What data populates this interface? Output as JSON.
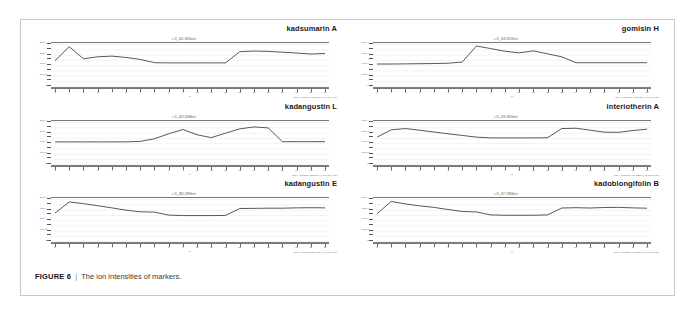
{
  "figure": {
    "caption_label": "FIGURE 6",
    "caption_separator": "|",
    "caption_text": "The ion intensities of markers.",
    "frame_color": "#c8c8c8",
    "background": "#ffffff",
    "line_color": "#3a3a3a"
  },
  "axis_defaults": {
    "x_caption": "h",
    "x_tick_labels": [
      "0",
      "1",
      "2",
      "3",
      "4",
      "5",
      "6",
      "7",
      "8",
      "9",
      "10",
      "11",
      "12",
      "13",
      "14",
      "15",
      "16",
      "17",
      "18",
      "19"
    ],
    "y_tick_labels": [
      "2.0e4",
      "1.5e4",
      "1.0e4",
      "5.0e3",
      "0",
      "-5.0e3",
      "-1.0e4"
    ]
  },
  "chart_data": [
    {
      "id": "kadsumarin-a",
      "type": "line",
      "title": "kadsumarin A",
      "header": "c.f1_401.1805m/z",
      "footer": "MS(+) extracted 401.1805 @ 9.7-11.9 min",
      "xlabel": "h",
      "ylabel": "",
      "x": [
        0,
        1,
        2,
        3,
        4,
        5,
        6,
        7,
        8,
        9,
        10,
        11,
        12,
        13,
        14,
        15,
        16,
        17,
        18,
        19
      ],
      "values": [
        6200,
        14800,
        7400,
        8600,
        9000,
        8200,
        7000,
        5000,
        4900,
        4900,
        4900,
        4900,
        4900,
        11700,
        12100,
        11900,
        11400,
        10900,
        10300,
        10600
      ],
      "ylim": [
        -11000,
        17000
      ],
      "y_ticks": [
        16000,
        12800,
        9600,
        6400,
        3200,
        0,
        -3200,
        -6400,
        -9600
      ],
      "y_tick_labels": [
        "2.0e 4",
        "1.5e 4",
        "1.0e 4",
        "5.0e 3",
        "0",
        "-5.0e 3",
        "-1.0e 4"
      ],
      "grid": true,
      "legend": "none"
    },
    {
      "id": "gomisin-h",
      "type": "line",
      "title": "gomisin H",
      "header": "c.f1_418.2037m/z",
      "footer": "MS(+) extracted 418.2037 @ 8.4-10.2 min",
      "xlabel": "h",
      "ylabel": "",
      "x": [
        0,
        1,
        2,
        3,
        4,
        5,
        6,
        7,
        8,
        9,
        10,
        11,
        12,
        13,
        14,
        15,
        16,
        17,
        18,
        19
      ],
      "values": [
        4200,
        4200,
        4300,
        4400,
        4500,
        4700,
        5400,
        15200,
        13600,
        12000,
        11000,
        12200,
        10400,
        8600,
        5000,
        5000,
        5000,
        5000,
        5000,
        5000
      ],
      "ylim": [
        -11000,
        17000
      ],
      "y_ticks": [
        16000,
        12800,
        9600,
        6400,
        3200,
        0,
        -3200,
        -6400,
        -9600
      ],
      "y_tick_labels": [
        "2.0e 4",
        "1.5e 4",
        "1.0e 4",
        "5.0e 3",
        "0",
        "-5.0e 3",
        "-1.0e 4"
      ],
      "grid": true,
      "legend": "none"
    },
    {
      "id": "kadangustin-l",
      "type": "line",
      "title": "kadangustin L",
      "header": "c.f1_432.2068m/z",
      "footer": "MS(+) extracted 432.2068 @ 10.1-12.4 min",
      "xlabel": "h",
      "ylabel": "",
      "x": [
        0,
        1,
        2,
        3,
        4,
        5,
        6,
        7,
        8,
        9,
        10,
        11,
        12,
        13,
        14,
        15,
        16,
        17,
        18,
        19
      ],
      "values": [
        4300,
        4300,
        4300,
        4300,
        4300,
        4300,
        4600,
        6200,
        9200,
        11800,
        8600,
        6900,
        9600,
        12200,
        13400,
        12800,
        4400,
        4400,
        4400,
        4400
      ],
      "ylim": [
        -11000,
        17000
      ],
      "y_ticks": [
        16000,
        12800,
        9600,
        6400,
        3200,
        0,
        -3200,
        -6400,
        -9600
      ],
      "y_tick_labels": [
        "2.0e 4",
        "1.5e 4",
        "1.0e 4",
        "5.0e 3",
        "0",
        "-5.0e 3",
        "-1.0e 4"
      ],
      "grid": true,
      "legend": "none"
    },
    {
      "id": "interiotherin-a",
      "type": "line",
      "title": "interiotherin A",
      "header": "c.f1_416.1850m/z",
      "footer": "MS(+) extracted 416.1850 @ 11.2-13.6 min",
      "xlabel": "h",
      "ylabel": "",
      "x": [
        0,
        1,
        2,
        3,
        4,
        5,
        6,
        7,
        8,
        9,
        10,
        11,
        12,
        13,
        14,
        15,
        16,
        17,
        18,
        19
      ],
      "values": [
        7200,
        11600,
        12400,
        11400,
        10300,
        9200,
        8200,
        7200,
        6700,
        6700,
        6700,
        6700,
        6800,
        12400,
        12600,
        11400,
        10200,
        10100,
        11200,
        12000
      ],
      "ylim": [
        -11000,
        17000
      ],
      "y_ticks": [
        16000,
        12800,
        9600,
        6400,
        3200,
        0,
        -3200,
        -6400,
        -9600
      ],
      "y_tick_labels": [
        "2.0e 4",
        "1.5e 4",
        "1.0e 4",
        "5.0e 3",
        "0",
        "-5.0e 3",
        "-1.0e 4"
      ],
      "grid": true,
      "legend": "none"
    },
    {
      "id": "kadangustin-e",
      "type": "line",
      "title": "kadangustin E",
      "header": "c.f1_382.1989m/z",
      "footer": "MS(+) extracted 382.1989 @ 9.3-11.7 min",
      "xlabel": "h",
      "ylabel": "",
      "x": [
        0,
        1,
        2,
        3,
        4,
        5,
        6,
        7,
        8,
        9,
        10,
        11,
        12,
        13,
        14,
        15,
        16,
        17,
        18,
        19
      ],
      "values": [
        7800,
        14600,
        13600,
        12300,
        11000,
        9600,
        8600,
        8400,
        6600,
        6300,
        6300,
        6300,
        6400,
        10600,
        10700,
        10800,
        10800,
        11000,
        11100,
        11000
      ],
      "ylim": [
        -11000,
        17000
      ],
      "y_ticks": [
        16000,
        12800,
        9600,
        6400,
        3200,
        0,
        -3200,
        -6400,
        -9600
      ],
      "y_tick_labels": [
        "2.0e 4",
        "1.5e 4",
        "1.0e 4",
        "5.0e 3",
        "0",
        "-5.0e 3",
        "-1.0e 4"
      ],
      "grid": true,
      "legend": "none"
    },
    {
      "id": "kadoblongifolin-b",
      "type": "line",
      "title": "kadoblongifolin B",
      "header": "c.f1_417.1884m/z",
      "footer": "MS(+) extracted 417.1884 @ 10.5-12.8 min",
      "xlabel": "h",
      "ylabel": "",
      "x": [
        0,
        1,
        2,
        3,
        4,
        5,
        6,
        7,
        8,
        9,
        10,
        11,
        12,
        13,
        14,
        15,
        16,
        17,
        18,
        19
      ],
      "values": [
        7400,
        14900,
        13400,
        12200,
        11300,
        10000,
        8800,
        8500,
        6700,
        6500,
        6500,
        6500,
        6700,
        10900,
        11100,
        10900,
        11200,
        11300,
        11000,
        10800
      ],
      "ylim": [
        -11000,
        17000
      ],
      "y_ticks": [
        16000,
        12800,
        9600,
        6400,
        3200,
        0,
        -3200,
        -6400,
        -9600
      ],
      "y_tick_labels": [
        "2.0e 4",
        "1.5e 4",
        "1.0e 4",
        "5.0e 3",
        "0",
        "-5.0e 3",
        "-1.0e 4"
      ],
      "grid": true,
      "legend": "none"
    }
  ]
}
